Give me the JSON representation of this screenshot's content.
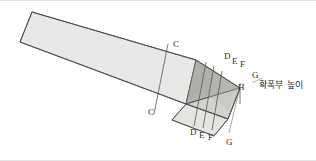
{
  "figure": {
    "width": 316,
    "height": 161,
    "background": "#ffffff",
    "frame_color": "#e3e3e3"
  },
  "colors": {
    "body_fill": "#e8e8e6",
    "top_face_fill": "#dededc",
    "taper_fill": "#b9b9b5",
    "end_face_fill": "#cdcdc9",
    "side_band_fill": "#d6d6d2",
    "outline": "#4a4a4a",
    "section_line": "#555555",
    "leader_line": "#8a8a8a",
    "text": "#2b2b2b"
  },
  "labels": {
    "section_c_top": "C",
    "section_c_bottom": "C",
    "section_d_top": "D",
    "section_e_top": "E",
    "section_f_top": "F",
    "section_g_top": "G",
    "section_d_bottom": "D",
    "section_e_bottom": "E",
    "section_f_bottom": "F",
    "section_g_bottom": "G",
    "height_marker": "H",
    "annotation_height": "확폭부 높이"
  },
  "geometry": {
    "body_top_edge": "32,12 196,60",
    "body_bottom_edge": "20,42 186,104",
    "end_cap": "196,60 240,88 228,118 186,104",
    "taper_triangle": "196,60 240,88 186,104",
    "section_lines": [
      {
        "name": "C",
        "x1": 166,
        "y1": 48,
        "x2": 155,
        "y2": 113
      },
      {
        "name": "D",
        "x1": 206,
        "y1": 65,
        "x2": 196,
        "y2": 124
      },
      {
        "name": "E",
        "x1": 214,
        "y1": 69,
        "x2": 204,
        "y2": 125
      },
      {
        "name": "F",
        "x1": 222,
        "y1": 74,
        "x2": 212,
        "y2": 127
      },
      {
        "name": "G",
        "x1": 238,
        "y1": 86,
        "x2": 228,
        "y2": 131
      }
    ]
  }
}
